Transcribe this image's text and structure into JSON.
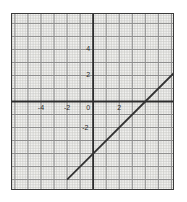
{
  "figure": {
    "name": "coordinate-plane-line-graph",
    "background_color": "#ffffff",
    "plot_background_color": "#f2f2f0",
    "border_color": "#3a3a3a",
    "axis_color": "#2b2b2b",
    "major_grid_color": "#8c8c8c",
    "minor_grid_color": "#c8c8c4",
    "line_color": "#333333"
  },
  "chart_data": {
    "type": "line",
    "title": "",
    "xlabel": "",
    "ylabel": "",
    "xlim": [
      -6.3,
      6.2
    ],
    "ylim": [
      -6.8,
      6.8
    ],
    "grid": true,
    "minor_grid": true,
    "major_tick_step": 1,
    "minor_ticks_per_major": 5,
    "legend": "none",
    "x_tick_labels": [
      "-4",
      "-2",
      "0",
      "2"
    ],
    "x_tick_values": [
      -4,
      -2,
      0,
      2
    ],
    "y_tick_labels": [
      "4",
      "2",
      "0",
      "-2"
    ],
    "y_tick_values": [
      4,
      2,
      0,
      -2
    ],
    "series": [
      {
        "name": "line",
        "equation": "y = x - 4",
        "slope": 1,
        "y_intercept": -4,
        "x_intercept": 4,
        "points": [
          {
            "x": -2.0,
            "y": -6.0
          },
          {
            "x": 0.0,
            "y": -4.0
          },
          {
            "x": 4.0,
            "y": 0.0
          },
          {
            "x": 6.2,
            "y": 2.2
          }
        ]
      }
    ]
  },
  "x_ticks": [
    {
      "label": "-4",
      "value": -4
    },
    {
      "label": "-2",
      "value": -2
    },
    {
      "label": "0",
      "value": 0
    },
    {
      "label": "2",
      "value": 2
    }
  ],
  "y_ticks": [
    {
      "label": "4",
      "value": 4
    },
    {
      "label": "2",
      "value": 2
    },
    {
      "label": "-2",
      "value": -2
    }
  ]
}
